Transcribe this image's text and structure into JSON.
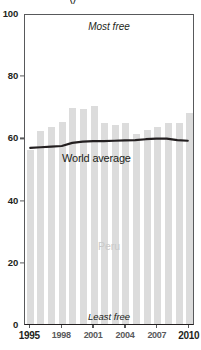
{
  "chart_data": {
    "type": "bar",
    "title": "",
    "xlabel": "",
    "ylabel": "",
    "ylim": [
      0,
      100
    ],
    "yticks": [
      0,
      20,
      40,
      60,
      80,
      100
    ],
    "grid": false,
    "legend": "in-plot labels",
    "categories": [
      "1995",
      "1996",
      "1997",
      "1998",
      "1999",
      "2000",
      "2001",
      "2002",
      "2003",
      "2004",
      "2005",
      "2006",
      "2007",
      "2008",
      "2009",
      "2010"
    ],
    "series": [
      {
        "name": "Peru",
        "type": "bar",
        "color": "#dcdcdc",
        "values": [
          56,
          62,
          63.5,
          65,
          69.5,
          69,
          70,
          64.5,
          64,
          64.5,
          61,
          62.5,
          63.5,
          64.5,
          64.5,
          68
        ]
      },
      {
        "name": "World average",
        "type": "line",
        "color": "#231f20",
        "values": [
          57,
          57.2,
          57.4,
          57.6,
          58.6,
          59,
          59.2,
          59.2,
          59.3,
          59.4,
          59.5,
          59.8,
          60,
          60,
          59.5,
          59.3
        ]
      }
    ],
    "annotations": [
      {
        "name": "most-free",
        "text": "Most free",
        "position": "top-center"
      },
      {
        "name": "least-free",
        "text": "Least free",
        "position": "bottom-center"
      },
      {
        "name": "world-average",
        "text": "World average",
        "position": "mid-left"
      },
      {
        "name": "peru",
        "text": "Peru",
        "position": "center"
      }
    ]
  },
  "axes": {
    "y_tick_labels": [
      "100",
      "80",
      "60",
      "40",
      "20",
      "0"
    ],
    "y_tick_values": [
      100,
      80,
      60,
      40,
      20,
      0
    ],
    "x_tick_labels": [
      "1995",
      "1998",
      "2001",
      "2004",
      "2007",
      "2010"
    ],
    "x_tick_values": [
      1995,
      1998,
      2001,
      2004,
      2007,
      2010
    ]
  },
  "labels": {
    "most_free": "Most free",
    "least_free": "Least free",
    "world_average": "World average",
    "peru": "Peru"
  },
  "colors": {
    "bar": "#dcdcdc",
    "line": "#231f20",
    "axis": "#58595b",
    "text": "#231f20",
    "peru_label": "#c9c9c9",
    "background": "#ffffff"
  }
}
